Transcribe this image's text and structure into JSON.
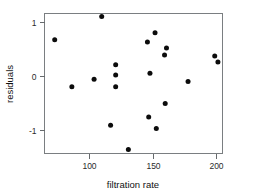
{
  "chart_data": {
    "type": "scatter",
    "title": "",
    "xlabel": "filtration rate",
    "ylabel": "residuals",
    "xlim": [
      70,
      206
    ],
    "ylim": [
      -1.45,
      1.25
    ],
    "xticks": [
      100,
      150,
      200
    ],
    "xticklabels": [
      "100",
      "150",
      "200"
    ],
    "yticks": [
      1,
      0,
      -1
    ],
    "yticklabels": [
      "1",
      "0",
      "-1"
    ],
    "grid": false,
    "legend": null,
    "marker": "filled-circle",
    "marker_color": "#0c0c0c",
    "series": [
      {
        "name": "residuals",
        "points": [
          {
            "x": 73.0,
            "y": 0.67
          },
          {
            "x": 86.5,
            "y": -0.2
          },
          {
            "x": 110.0,
            "y": 1.1
          },
          {
            "x": 104.0,
            "y": -0.06
          },
          {
            "x": 121.0,
            "y": 0.21
          },
          {
            "x": 121.0,
            "y": 0.02
          },
          {
            "x": 121.0,
            "y": -0.2
          },
          {
            "x": 117.0,
            "y": -0.91
          },
          {
            "x": 131.0,
            "y": -1.36
          },
          {
            "x": 146.0,
            "y": 0.63
          },
          {
            "x": 152.0,
            "y": 0.8
          },
          {
            "x": 148.0,
            "y": 0.05
          },
          {
            "x": 147.0,
            "y": -0.76
          },
          {
            "x": 153.0,
            "y": -0.97
          },
          {
            "x": 160.0,
            "y": -0.51
          },
          {
            "x": 161.0,
            "y": 0.52
          },
          {
            "x": 159.5,
            "y": 0.39
          },
          {
            "x": 178.0,
            "y": -0.1
          },
          {
            "x": 199.0,
            "y": 0.37
          },
          {
            "x": 201.5,
            "y": 0.26
          }
        ]
      }
    ]
  },
  "labels": {
    "xlabel": "filtration rate",
    "ylabel": "residuals"
  }
}
